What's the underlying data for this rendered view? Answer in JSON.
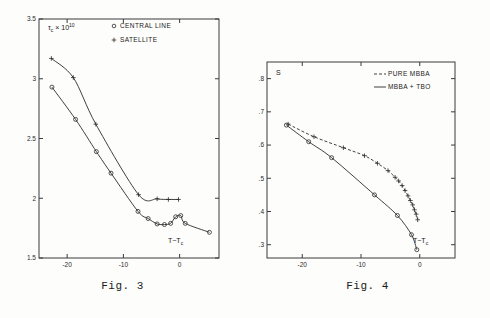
{
  "page": {
    "background_color": "#fdfdfc",
    "ink_color": "#2a2a2a"
  },
  "figures": [
    {
      "id": "figure-3",
      "caption": "Fig. 3"
    },
    {
      "id": "figure-4",
      "caption": "Fig. 4"
    }
  ],
  "chart_data": [
    {
      "type": "line",
      "id": "figure-3",
      "title": "",
      "caption": "Fig. 3",
      "ylabel": "τc × 10",
      "ylabel_parts": {
        "symbol": "τ",
        "subscript": "c",
        "times": "× 10",
        "exponent": "10"
      },
      "xlabel": "T−Tc",
      "xlabel_parts": {
        "main": "T−T",
        "subscript": "c"
      },
      "xlim": [
        -25,
        7
      ],
      "ylim": [
        1.5,
        3.5
      ],
      "xticks": [
        -20,
        -10,
        0
      ],
      "xtick_labels": [
        "-20",
        "-10",
        "0"
      ],
      "yticks": [
        1.5,
        2,
        2.5,
        3,
        3.5
      ],
      "ytick_labels": [
        "1.5",
        "2",
        "2.5",
        "3",
        "3.5"
      ],
      "grid": false,
      "frame": "box",
      "legend_position": "top-right",
      "series": [
        {
          "name": "CENTRAL LINE",
          "marker": "circle",
          "linestyle": "solid",
          "x": [
            -22.7,
            -18.5,
            -14.8,
            -12.2,
            -7.4,
            -5.6,
            -4.0,
            -2.7,
            -1.6,
            -0.7,
            0.2,
            1.0,
            5.3
          ],
          "y": [
            2.93,
            2.66,
            2.39,
            2.21,
            1.89,
            1.83,
            1.785,
            1.78,
            1.79,
            1.845,
            1.855,
            1.79,
            1.715
          ]
        },
        {
          "name": "SATELLITE",
          "marker": "plus",
          "linestyle": "solid",
          "x": [
            -22.8,
            -18.9,
            -14.9,
            -7.3,
            -4.0,
            -2.0,
            -0.2
          ],
          "y": [
            3.17,
            3.01,
            2.62,
            2.03,
            1.995,
            1.99,
            1.99
          ]
        }
      ],
      "legend": [
        {
          "label": "CENTRAL LINE",
          "marker": "circle"
        },
        {
          "label": "SATELLITE",
          "marker": "plus"
        }
      ]
    },
    {
      "type": "line",
      "id": "figure-4",
      "title": "",
      "caption": "Fig. 4",
      "ylabel": "S",
      "xlabel": "T−Tc",
      "xlabel_parts": {
        "main": "T−T",
        "subscript": "c"
      },
      "xlim": [
        -26,
        6
      ],
      "ylim": [
        0.26,
        0.85
      ],
      "xticks": [
        -20,
        -10,
        0
      ],
      "xtick_labels": [
        "-20",
        "-10",
        "0"
      ],
      "yticks": [
        0.3,
        0.4,
        0.5,
        0.6,
        0.7,
        0.8
      ],
      "ytick_labels": [
        ".3",
        ".4",
        ".5",
        ".6",
        ".7",
        ".8"
      ],
      "grid": false,
      "frame": "box",
      "legend_position": "top-right",
      "series": [
        {
          "name": "PURE MBBA",
          "marker": "plus",
          "linestyle": "dashed",
          "x": [
            -22.4,
            -18.0,
            -13.0,
            -9.4,
            -7.2,
            -5.4,
            -4.2,
            -3.6,
            -3.0,
            -2.5,
            -2.0,
            -1.6,
            -1.2,
            -0.9,
            -0.6,
            -0.35
          ],
          "y": [
            0.663,
            0.625,
            0.592,
            0.568,
            0.545,
            0.523,
            0.503,
            0.492,
            0.478,
            0.463,
            0.447,
            0.433,
            0.42,
            0.405,
            0.392,
            0.375
          ]
        },
        {
          "name": "MBBA + TBO",
          "marker": "circle",
          "linestyle": "solid",
          "x": [
            -22.7,
            -18.9,
            -15.0,
            -7.7,
            -3.8,
            -1.4,
            -0.5
          ],
          "y": [
            0.66,
            0.61,
            0.562,
            0.45,
            0.388,
            0.33,
            0.285
          ]
        }
      ],
      "legend": [
        {
          "label": "PURE MBBA",
          "linestyle": "dashed"
        },
        {
          "label": "MBBA + TBO",
          "linestyle": "solid"
        }
      ]
    }
  ]
}
